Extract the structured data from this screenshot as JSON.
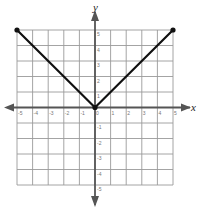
{
  "chart_data": {
    "type": "line",
    "title": "",
    "xlabel": "x",
    "ylabel": "y",
    "xlim": [
      -5,
      5
    ],
    "ylim": [
      -5,
      5
    ],
    "grid": true,
    "legend": null,
    "x_ticks": [
      "-5",
      "-4",
      "-3",
      "-2",
      "-1",
      "0",
      "1",
      "2",
      "3",
      "4",
      "5"
    ],
    "y_ticks": [
      "5",
      "4",
      "3",
      "2",
      "1",
      "-1",
      "-2",
      "-3",
      "-4",
      "-5"
    ],
    "series": [
      {
        "name": "y = |x|",
        "x": [
          -5,
          0,
          5
        ],
        "y": [
          5,
          0,
          5
        ],
        "endpoints": [
          [
            -5,
            5
          ],
          [
            0,
            0
          ],
          [
            5,
            5
          ]
        ]
      }
    ]
  },
  "colors": {
    "grid": "#9a9a9a",
    "axis": "#555555",
    "line": "#111111"
  }
}
